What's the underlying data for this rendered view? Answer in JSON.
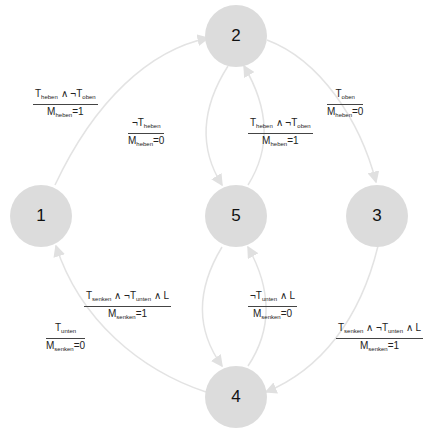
{
  "diagram": {
    "type": "state-machine",
    "node_color": "#dcdcdc",
    "edge_color": "#e0e0e0",
    "nodes": [
      {
        "id": "1",
        "label": "1"
      },
      {
        "id": "2",
        "label": "2"
      },
      {
        "id": "3",
        "label": "3"
      },
      {
        "id": "4",
        "label": "4"
      },
      {
        "id": "5",
        "label": "5"
      }
    ],
    "edges": [
      {
        "from": "1",
        "to": "2",
        "condition": "T_heben ∧ ¬T_oben",
        "action": "M_heben=1"
      },
      {
        "from": "2",
        "to": "3",
        "condition": "T_oben",
        "action": "M_heben=0"
      },
      {
        "from": "2",
        "to": "5",
        "condition": "¬T_heben",
        "action": "M_heben=0"
      },
      {
        "from": "5",
        "to": "2",
        "condition": "T_heben ∧ ¬T_oben",
        "action": "M_heben=1"
      },
      {
        "from": "3",
        "to": "4",
        "condition": "T_senken ∧ ¬T_unten ∧ L",
        "action": "M_senken=1"
      },
      {
        "from": "5",
        "to": "4",
        "condition": "T_senken ∧ ¬T_unten ∧ L",
        "action": "M_senken=1"
      },
      {
        "from": "4",
        "to": "5",
        "condition": "¬T_unten ∧ L",
        "action": "M_senken=0"
      },
      {
        "from": "4",
        "to": "1",
        "condition": "T_unten",
        "action": "M_senken=0"
      }
    ]
  },
  "text": {
    "T": "T",
    "M": "M",
    "L": "L",
    "and": " ∧ ",
    "not": "¬",
    "heben": "heben",
    "oben": "oben",
    "senken": "senken",
    "unten": "unten",
    "eq0": "=0",
    "eq1": "=1"
  }
}
